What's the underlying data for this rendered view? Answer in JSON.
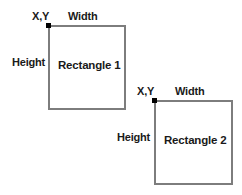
{
  "diagram": {
    "type": "rectangle-coordinate-illustration",
    "background_color": "#ffffff",
    "stroke_color": "#7d7d7d",
    "marker_color": "#000000",
    "text_color": "#1a1a1a",
    "shapes": [
      {
        "id": "rectangle-1",
        "body_label": "Rectangle 1",
        "origin_label": "X,Y",
        "width_label": "Width",
        "height_label": "Height",
        "x": 48,
        "y": 25,
        "width": 78,
        "height": 85
      },
      {
        "id": "rectangle-2",
        "body_label": "Rectangle 2",
        "origin_label": "X,Y",
        "width_label": "Width",
        "height_label": "Height",
        "x": 154,
        "y": 100,
        "width": 79,
        "height": 85
      }
    ]
  }
}
